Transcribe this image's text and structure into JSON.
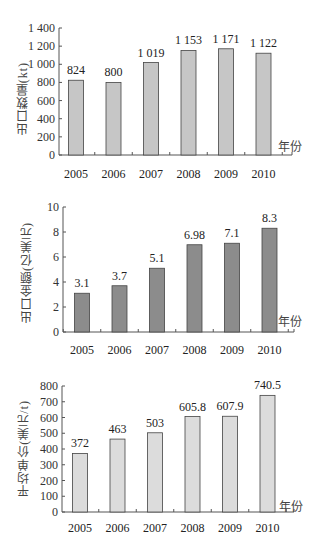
{
  "chart_data": [
    {
      "type": "bar",
      "title": "",
      "xlabel": "年份",
      "ylabel": "出口数量(kt)",
      "categories": [
        "2005",
        "2006",
        "2007",
        "2008",
        "2009",
        "2010"
      ],
      "values": [
        824,
        800,
        1019,
        1153,
        1171,
        1122
      ],
      "value_labels": [
        "824",
        "800",
        "1 019",
        "1 153",
        "1 171",
        "1 122"
      ],
      "yticks": [
        0,
        200,
        400,
        600,
        800,
        1000,
        1200,
        1400
      ],
      "ytick_labels": [
        "0",
        "200",
        "400",
        "600",
        "800",
        "1 000",
        "1 200",
        "1 400"
      ],
      "ylim": [
        0,
        1400
      ],
      "grid": false,
      "bar_color": "#c6c6c6"
    },
    {
      "type": "bar",
      "title": "",
      "xlabel": "年份",
      "ylabel": "出口金额(亿美元)",
      "categories": [
        "2005",
        "2006",
        "2007",
        "2008",
        "2009",
        "2010"
      ],
      "values": [
        3.1,
        3.7,
        5.1,
        6.98,
        7.1,
        8.3
      ],
      "value_labels": [
        "3.1",
        "3.7",
        "5.1",
        "6.98",
        "7.1",
        "8.3"
      ],
      "yticks": [
        0,
        2,
        4,
        6,
        8,
        10
      ],
      "ytick_labels": [
        "0",
        "2",
        "4",
        "6",
        "8",
        "10"
      ],
      "ylim": [
        0,
        10
      ],
      "grid": false,
      "bar_color": "#8c8c8c"
    },
    {
      "type": "bar",
      "title": "",
      "xlabel": "年份",
      "ylabel": "平均单价(美元/t)",
      "categories": [
        "2005",
        "2006",
        "2007",
        "2008",
        "2009",
        "2010"
      ],
      "values": [
        372,
        463,
        503,
        605.8,
        607.9,
        740.5
      ],
      "value_labels": [
        "372",
        "463",
        "503",
        "605.8",
        "607.9",
        "740.5"
      ],
      "yticks": [
        0,
        100,
        200,
        300,
        400,
        500,
        600,
        700,
        800
      ],
      "ytick_labels": [
        "0",
        "100",
        "200",
        "300",
        "400",
        "500",
        "600",
        "700",
        "800"
      ],
      "ylim": [
        0,
        800
      ],
      "grid": false,
      "bar_color": "#dcdcdc"
    }
  ],
  "charts": [
    {
      "ylabel": "出口数量(kt)",
      "xunit": "年份"
    },
    {
      "ylabel": "出口金额(亿美元)",
      "xunit": "年份"
    },
    {
      "ylabel": "平均单价(美元/t)",
      "xunit": "年份"
    }
  ]
}
